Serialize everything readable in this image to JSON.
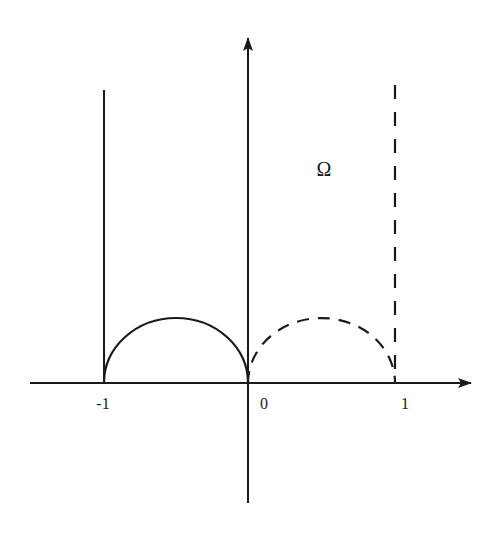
{
  "diagram": {
    "region_label": "Ω",
    "x_axis": {
      "ticks": [
        {
          "label": "-1",
          "value": -1
        },
        {
          "label": "0",
          "value": 0
        },
        {
          "label": "1",
          "value": 1
        }
      ]
    },
    "curves": [
      {
        "name": "left-vertical-line",
        "x": -1,
        "style": "solid"
      },
      {
        "name": "left-semicircle",
        "center": -0.5,
        "radius": 0.5,
        "style": "solid"
      },
      {
        "name": "right-semicircle",
        "center": 0.5,
        "radius": 0.5,
        "style": "dashed"
      },
      {
        "name": "right-vertical-line",
        "x": 1,
        "style": "dashed"
      }
    ],
    "colors": {
      "stroke": "#1a1a1a",
      "background": "#ffffff"
    }
  }
}
